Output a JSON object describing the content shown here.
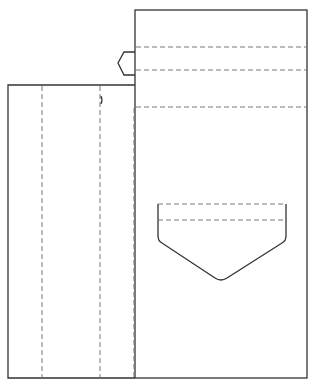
{
  "diagram": {
    "type": "pattern-template",
    "colors": {
      "line": "#333333",
      "dash": "#777777",
      "background": "#ffffff"
    },
    "panels": [
      {
        "name": "back-panel",
        "x": 135,
        "y": 10,
        "width": 172,
        "height": 368
      },
      {
        "name": "front-panel",
        "x": 8,
        "y": 85,
        "width": 127,
        "height": 293
      }
    ],
    "fold_lines_horizontal_y": [
      47,
      70,
      107
    ],
    "fold_lines_vertical_x": [
      42,
      100,
      134
    ],
    "tab": {
      "x_left": 118,
      "y_top": 52,
      "y_bottom": 75
    },
    "pocket": {
      "x_left": 158,
      "x_right": 286,
      "y_top": 204,
      "y_fold": 220,
      "y_shoulder": 240,
      "y_tip": 281
    }
  }
}
